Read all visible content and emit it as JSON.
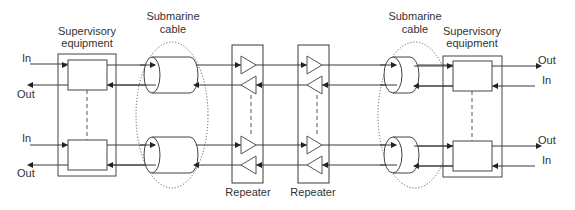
{
  "diagram": {
    "type": "block-diagram",
    "labels": {
      "left_supervisory": [
        "Supervisory",
        "equipment"
      ],
      "right_supervisory": [
        "Supervisory",
        "equipment"
      ],
      "left_cable": [
        "Submarine",
        "cable"
      ],
      "right_cable": [
        "Submarine",
        "cable"
      ],
      "repeater_1": "Repeater",
      "repeater_2": "Repeater"
    },
    "ports": {
      "left_top_in": "In",
      "left_top_out": "Out",
      "left_bottom_in": "In",
      "left_bottom_out": "Out",
      "right_top_out": "Out",
      "right_top_in": "In",
      "right_bottom_out": "Out",
      "right_bottom_in": "In"
    },
    "nodes": [
      {
        "id": "sup-left",
        "label": "Supervisory equipment",
        "channels": 2
      },
      {
        "id": "cable-left",
        "label": "Submarine cable",
        "fibers": 2
      },
      {
        "id": "rep-1",
        "label": "Repeater",
        "amplifiers": 4
      },
      {
        "id": "rep-2",
        "label": "Repeater",
        "amplifiers": 4
      },
      {
        "id": "cable-right",
        "label": "Submarine cable",
        "fibers": 2
      },
      {
        "id": "sup-right",
        "label": "Supervisory equipment",
        "channels": 2
      }
    ],
    "colors": {
      "line": "#3a3a3a",
      "text": "#333333",
      "background": "#ffffff"
    }
  }
}
